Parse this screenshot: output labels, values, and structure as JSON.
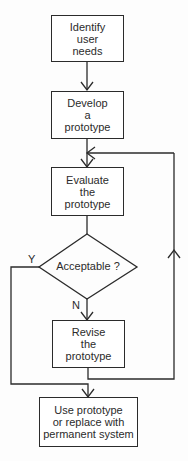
{
  "diagram": {
    "type": "flowchart",
    "nodes": [
      {
        "id": "identify",
        "shape": "rect",
        "lines": [
          "Identify",
          "user",
          "needs"
        ]
      },
      {
        "id": "develop",
        "shape": "rect",
        "lines": [
          "Develop",
          "a",
          "prototype"
        ]
      },
      {
        "id": "evaluate",
        "shape": "rect",
        "lines": [
          "Evaluate",
          "the",
          "prototype"
        ]
      },
      {
        "id": "acceptable",
        "shape": "diamond",
        "text": "Acceptable ?"
      },
      {
        "id": "revise",
        "shape": "rect",
        "lines": [
          "Revise",
          "the",
          "prototype"
        ]
      },
      {
        "id": "use",
        "shape": "rect",
        "lines": [
          "Use prototype",
          "or replace with",
          "permanent system"
        ]
      }
    ],
    "edges": [
      {
        "from": "identify",
        "to": "develop"
      },
      {
        "from": "develop",
        "to": "evaluate"
      },
      {
        "from": "evaluate",
        "to": "acceptable"
      },
      {
        "from": "acceptable",
        "to": "revise",
        "label": "N"
      },
      {
        "from": "acceptable",
        "to": "use",
        "label": "Y"
      },
      {
        "from": "revise",
        "to": "evaluate",
        "note": "loop back"
      }
    ],
    "labels": {
      "yes": "Y",
      "no": "N"
    },
    "colors": {
      "line": "#2b2b2b",
      "background": "#fdfdfd"
    }
  }
}
